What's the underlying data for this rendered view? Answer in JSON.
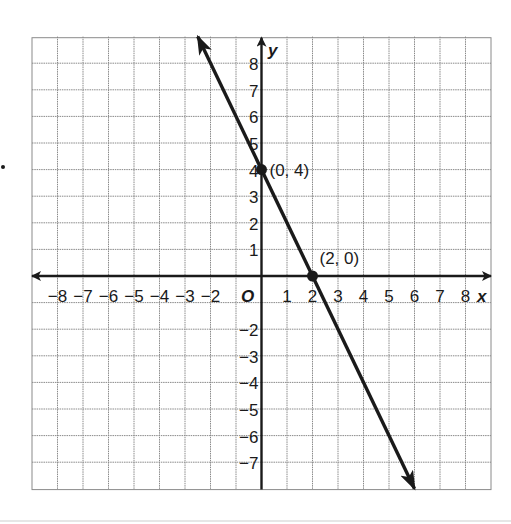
{
  "chart_data": {
    "type": "line",
    "title": "",
    "xlabel": "x",
    "ylabel": "y",
    "origin_label": "O",
    "xlim": [
      -9,
      9
    ],
    "ylim": [
      -8,
      9
    ],
    "grid": true,
    "x_tick_labels": [
      "−8",
      "−7",
      "−6",
      "−5",
      "−4",
      "−3",
      "−2",
      "1",
      "2",
      "3",
      "4",
      "5",
      "6",
      "7",
      "8"
    ],
    "x_tick_values": [
      -8,
      -7,
      -6,
      -5,
      -4,
      -3,
      -2,
      1,
      2,
      3,
      4,
      5,
      6,
      7,
      8
    ],
    "y_tick_labels": [
      "8",
      "7",
      "6",
      "5",
      "4",
      "3",
      "2",
      "1",
      "−2",
      "−3",
      "−4",
      "−5",
      "−6",
      "−7"
    ],
    "y_tick_values": [
      8,
      7,
      6,
      5,
      4,
      3,
      2,
      1,
      -2,
      -3,
      -4,
      -5,
      -6,
      -7
    ],
    "series": [
      {
        "name": "y = -2x + 4",
        "slope": -2,
        "intercept": 4,
        "x": [
          -2.5,
          6
        ],
        "y": [
          9,
          -8
        ],
        "arrows": "both",
        "color": "#1a1a1a"
      }
    ],
    "points": [
      {
        "x": 0,
        "y": 4,
        "label": "(0, 4)"
      },
      {
        "x": 2,
        "y": 0,
        "label": "(2, 0)"
      }
    ]
  },
  "colors": {
    "grid": "#8a8a8a",
    "ink": "#1a1a1a",
    "background": "#ffffff"
  }
}
